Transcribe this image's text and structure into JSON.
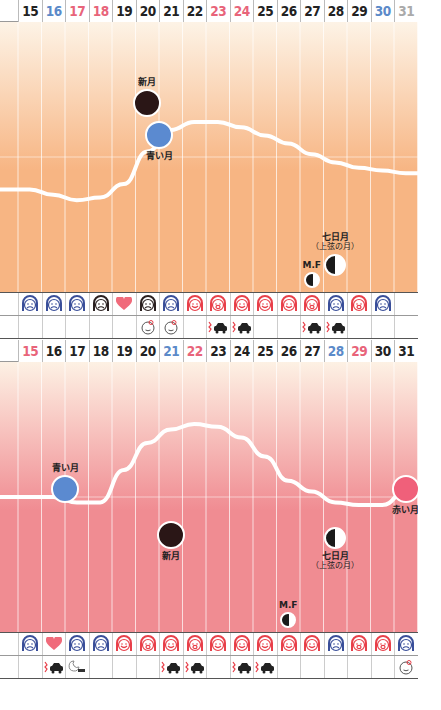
{
  "chart_data": [
    {
      "type": "line",
      "title": "",
      "background_gradient": [
        "#fdf3e6",
        "#f7b583"
      ],
      "days": [
        15,
        16,
        17,
        18,
        19,
        20,
        21,
        22,
        23,
        24,
        25,
        26,
        27,
        28,
        29,
        30,
        31
      ],
      "day_colors": [
        "#222",
        "#5b8ac9",
        "#e8647a",
        "#e8647a",
        "#222",
        "#222",
        "#222",
        "#222",
        "#e8647a",
        "#e8647a",
        "#222",
        "#222",
        "#222",
        "#222",
        "#222",
        "#5b8ac9",
        "#aaaaaa"
      ],
      "curve_y_normalized": [
        0.62,
        0.64,
        0.66,
        0.65,
        0.6,
        0.48,
        0.4,
        0.37,
        0.37,
        0.39,
        0.42,
        0.45,
        0.49,
        0.52,
        0.54,
        0.55,
        0.56
      ],
      "moons": [
        {
          "label": "新月",
          "day": 20,
          "phase": "new",
          "color": "#2a1616",
          "y_frac": 0.3
        },
        {
          "label": "青い月",
          "day": 20.5,
          "phase": "full",
          "color": "#5b8ad0",
          "y_frac": 0.42
        },
        {
          "label": "七日月",
          "sub": "（上弦の月）",
          "day": 28,
          "phase": "first-quarter",
          "color": "#1a1a1a",
          "y_frac": 0.9
        },
        {
          "label": "M.F",
          "day": 27,
          "phase": "crescent",
          "color": "#1a1a1a",
          "y_frac": 1.0
        }
      ],
      "face_row": [
        "sad-blue",
        "wink-blue",
        "angry-blue",
        "angry-dark",
        "heart",
        "angry-dark",
        "sad-blue",
        "smile-red",
        "cry-red",
        "smile-red",
        "smile-red",
        "smile-red",
        "cry-red",
        "sad-blue",
        "cry-red",
        "sad-blue",
        ""
      ],
      "event_row": [
        "",
        "",
        "",
        "",
        "",
        "baby",
        "baby",
        "",
        "crash",
        "crash",
        "",
        "",
        "crash",
        "crash",
        "",
        "",
        ""
      ]
    },
    {
      "type": "line",
      "title": "",
      "background_gradient": [
        "#fdf1e4",
        "#f08c92"
      ],
      "days": [
        15,
        16,
        17,
        18,
        19,
        20,
        21,
        22,
        23,
        24,
        25,
        26,
        27,
        28,
        29,
        30,
        31
      ],
      "day_colors": [
        "#e8647a",
        "#222",
        "#222",
        "#222",
        "#222",
        "#222",
        "#5b8ac9",
        "#e8647a",
        "#222",
        "#222",
        "#222",
        "#222",
        "#222",
        "#5b8ac9",
        "#e8647a",
        "#222",
        "#222"
      ],
      "curve_y_normalized": [
        0.5,
        0.5,
        0.52,
        0.52,
        0.4,
        0.3,
        0.25,
        0.23,
        0.24,
        0.28,
        0.35,
        0.44,
        0.48,
        0.52,
        0.53,
        0.53,
        0.48
      ],
      "moons": [
        {
          "label": "青い月",
          "day": 16.5,
          "phase": "full",
          "color": "#5b8ad0",
          "y_frac": 0.47
        },
        {
          "label": "新月",
          "day": 21,
          "phase": "new",
          "color": "#2a1616",
          "y_frac": 0.64
        },
        {
          "label": "七日月",
          "sub": "（上弦の月）",
          "day": 28,
          "phase": "first-quarter",
          "color": "#1a1a1a",
          "y_frac": 0.65
        },
        {
          "label": "赤い月",
          "day": 31,
          "phase": "full",
          "color": "#f0607a",
          "y_frac": 0.47
        },
        {
          "label": "M.F",
          "day": 26,
          "phase": "crescent",
          "color": "#1a1a1a",
          "y_frac": 1.0
        }
      ],
      "face_row": [
        "sad-blue",
        "heart",
        "angry-blue",
        "sad-blue",
        "smile-red",
        "cry-red",
        "smile-red",
        "cry-red",
        "smile-red",
        "smile-red",
        "smile-red",
        "smile-red",
        "smile-red",
        "sad-blue",
        "cry-red",
        "cry-red",
        "sad-blue"
      ],
      "event_row": [
        "",
        "crash",
        "moon-sleep",
        "",
        "",
        "",
        "crash",
        "crash",
        "",
        "crash",
        "crash",
        "",
        "",
        "",
        "",
        "",
        "baby"
      ]
    }
  ]
}
